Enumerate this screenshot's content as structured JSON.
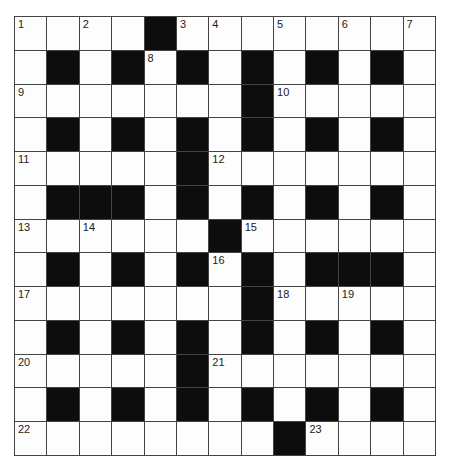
{
  "puzzle": {
    "type": "crossword",
    "rows": 13,
    "cols": 13,
    "grid": [
      "....#........",
      ".#.#.#.#.#.#.",
      ".......#.....",
      ".#.#.#.#.#.#.",
      ".....#.......",
      ".###.#.#.#.#.",
      "......#......",
      ".#.#.#.#.###.",
      ".......#.....",
      ".#.#.#.#.#.#.",
      ".....#.......",
      ".#.#.#.#.#.#.",
      "........#...."
    ],
    "numbers": [
      {
        "r": 0,
        "c": 0,
        "n": "1"
      },
      {
        "r": 0,
        "c": 2,
        "n": "2"
      },
      {
        "r": 0,
        "c": 5,
        "n": "3"
      },
      {
        "r": 0,
        "c": 6,
        "n": "4"
      },
      {
        "r": 0,
        "c": 8,
        "n": "5"
      },
      {
        "r": 0,
        "c": 10,
        "n": "6"
      },
      {
        "r": 0,
        "c": 12,
        "n": "7"
      },
      {
        "r": 1,
        "c": 4,
        "n": "8"
      },
      {
        "r": 2,
        "c": 0,
        "n": "9"
      },
      {
        "r": 2,
        "c": 8,
        "n": "10"
      },
      {
        "r": 4,
        "c": 0,
        "n": "11"
      },
      {
        "r": 4,
        "c": 6,
        "n": "12"
      },
      {
        "r": 6,
        "c": 0,
        "n": "13"
      },
      {
        "r": 6,
        "c": 2,
        "n": "14"
      },
      {
        "r": 6,
        "c": 7,
        "n": "15"
      },
      {
        "r": 7,
        "c": 6,
        "n": "16"
      },
      {
        "r": 8,
        "c": 0,
        "n": "17"
      },
      {
        "r": 8,
        "c": 8,
        "n": "18"
      },
      {
        "r": 8,
        "c": 10,
        "n": "19"
      },
      {
        "r": 10,
        "c": 0,
        "n": "20"
      },
      {
        "r": 10,
        "c": 6,
        "n": "21"
      },
      {
        "r": 12,
        "c": 0,
        "n": "22"
      },
      {
        "r": 12,
        "c": 9,
        "n": "23"
      }
    ]
  }
}
